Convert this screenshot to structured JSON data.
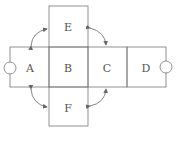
{
  "diagram": {
    "type": "cube-net",
    "faces": [
      {
        "id": "E",
        "label": "E"
      },
      {
        "id": "A",
        "label": "A"
      },
      {
        "id": "B",
        "label": "B"
      },
      {
        "id": "C",
        "label": "C"
      },
      {
        "id": "D",
        "label": "D"
      },
      {
        "id": "F",
        "label": "F"
      }
    ],
    "colors": {
      "stroke": "#777777",
      "text": "#555555",
      "arrow": "#666666"
    }
  }
}
